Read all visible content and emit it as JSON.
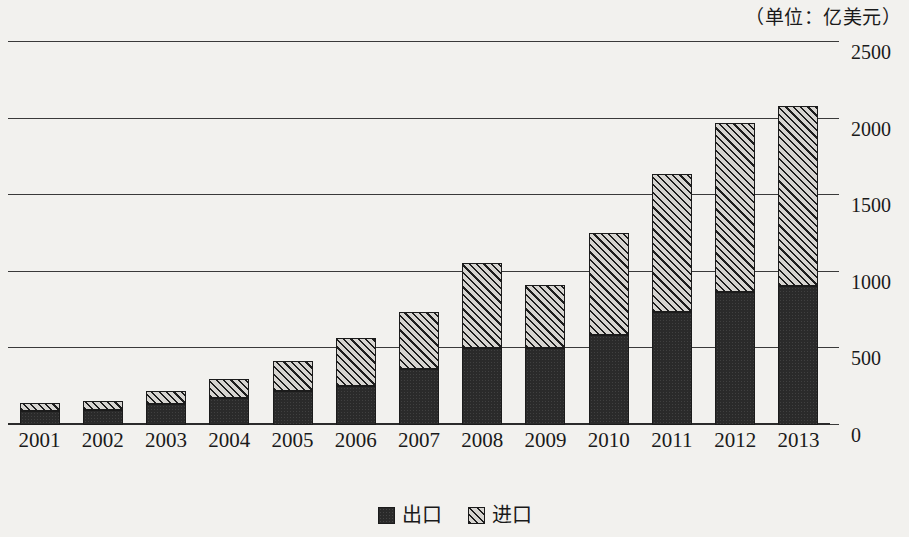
{
  "caption": {
    "unit_note": "（单位：亿美元）"
  },
  "legend": {
    "position": "bottom-center",
    "entries": [
      {
        "key": "export",
        "label": "出口",
        "pattern": "solid-dark",
        "color": "#2a2a2a"
      },
      {
        "key": "import",
        "label": "进口",
        "pattern": "diagonal-hatch",
        "color": "#d6d4d0"
      }
    ]
  },
  "axis": {
    "y_ticks": [
      "0",
      "500",
      "1000",
      "1500",
      "2000",
      "2500"
    ],
    "x_ticks": [
      "2001",
      "2002",
      "2003",
      "2004",
      "2005",
      "2006",
      "2007",
      "2008",
      "2009",
      "2010",
      "2011",
      "2012",
      "2013"
    ]
  },
  "chart_data": {
    "type": "bar",
    "stacked": true,
    "title": "",
    "subtitle": "",
    "annotation": "（单位：亿美元）",
    "xlabel": "",
    "ylabel": "",
    "ylim": [
      0,
      2500
    ],
    "ytick_step": 500,
    "grid": true,
    "legend_position": "bottom-center",
    "categories": [
      "2001",
      "2002",
      "2003",
      "2004",
      "2005",
      "2006",
      "2007",
      "2008",
      "2009",
      "2010",
      "2011",
      "2012",
      "2013"
    ],
    "series": [
      {
        "name": "出口",
        "key": "export",
        "color": "#2a2a2a",
        "values": [
          90,
          100,
          135,
          175,
          225,
          255,
          365,
          505,
          500,
          590,
          735,
          865,
          910
        ]
      },
      {
        "name": "进口",
        "key": "import",
        "color": "#d6d4d0",
        "values": [
          55,
          60,
          90,
          125,
          190,
          310,
          370,
          555,
          415,
          665,
          905,
          1105,
          1175
        ]
      }
    ],
    "totals": [
      145,
      160,
      225,
      300,
      415,
      565,
      735,
      1060,
      915,
      1255,
      1640,
      1970,
      2085
    ]
  }
}
